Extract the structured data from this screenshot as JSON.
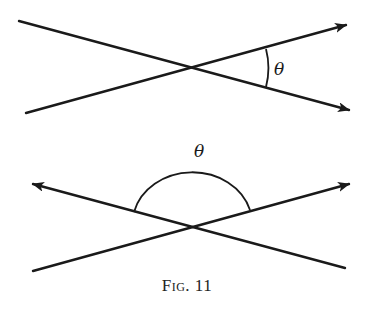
{
  "figure": {
    "caption": "Fig. 11",
    "top_diagram": {
      "angle_label": "θ",
      "description": "Two lines crossing; acute angle θ between two rightward rays"
    },
    "bottom_diagram": {
      "angle_label": "θ",
      "description": "Two lines crossing; obtuse angle θ between upper-left and upper-right rays"
    },
    "colors": {
      "line": "#1a1a1a",
      "background": "#ffffff"
    }
  }
}
